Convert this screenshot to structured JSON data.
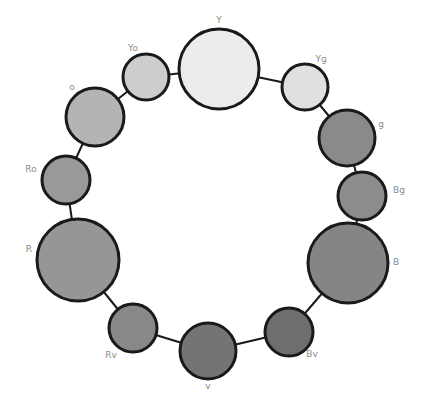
{
  "diagram": {
    "type": "color-wheel-circles",
    "nodes": [
      {
        "id": "Y",
        "label": "Y",
        "cx": 219,
        "cy": 69,
        "r": 40,
        "fill": "#ececec",
        "lx": 219,
        "ly": 23,
        "anchor": "middle"
      },
      {
        "id": "Yg",
        "label": "Yg",
        "cx": 305,
        "cy": 87,
        "r": 23,
        "fill": "#e0e0e0",
        "lx": 321,
        "ly": 62,
        "anchor": "middle"
      },
      {
        "id": "g",
        "label": "g",
        "cx": 347,
        "cy": 138,
        "r": 28,
        "fill": "#8a8a8a",
        "lx": 381,
        "ly": 127,
        "anchor": "middle"
      },
      {
        "id": "Bg",
        "label": "Bg",
        "cx": 362,
        "cy": 196,
        "r": 24,
        "fill": "#8c8c8c",
        "lx": 399,
        "ly": 193,
        "anchor": "middle"
      },
      {
        "id": "B",
        "label": "B",
        "cx": 348,
        "cy": 263,
        "r": 40,
        "fill": "#858585",
        "lx": 396,
        "ly": 265,
        "anchor": "middle"
      },
      {
        "id": "Bv",
        "label": "Bv",
        "cx": 289,
        "cy": 332,
        "r": 24,
        "fill": "#6e6e6e",
        "lx": 312,
        "ly": 357,
        "anchor": "middle"
      },
      {
        "id": "v",
        "label": "v",
        "cx": 208,
        "cy": 351,
        "r": 28,
        "fill": "#747474",
        "lx": 208,
        "ly": 389,
        "anchor": "middle"
      },
      {
        "id": "Rv",
        "label": "Rv",
        "cx": 133,
        "cy": 328,
        "r": 24,
        "fill": "#888888",
        "lx": 111,
        "ly": 358,
        "anchor": "middle"
      },
      {
        "id": "R",
        "label": "R",
        "cx": 78,
        "cy": 260,
        "r": 41,
        "fill": "#969696",
        "lx": 29,
        "ly": 252,
        "anchor": "middle"
      },
      {
        "id": "Ro",
        "label": "Ro",
        "cx": 66,
        "cy": 180,
        "r": 24,
        "fill": "#999999",
        "lx": 31,
        "ly": 172,
        "anchor": "middle"
      },
      {
        "id": "o",
        "label": "o",
        "cx": 95,
        "cy": 117,
        "r": 29,
        "fill": "#b4b4b4",
        "lx": 72,
        "ly": 90,
        "anchor": "middle"
      },
      {
        "id": "Yo",
        "label": "Yo",
        "cx": 146,
        "cy": 77,
        "r": 23,
        "fill": "#cdcdcd",
        "lx": 133,
        "ly": 51,
        "anchor": "middle"
      }
    ],
    "edges": [
      [
        "Y",
        "Yg"
      ],
      [
        "Yg",
        "g"
      ],
      [
        "g",
        "Bg"
      ],
      [
        "Bg",
        "B"
      ],
      [
        "B",
        "Bv"
      ],
      [
        "Bv",
        "v"
      ],
      [
        "v",
        "Rv"
      ],
      [
        "Rv",
        "R"
      ],
      [
        "R",
        "Ro"
      ],
      [
        "Ro",
        "o"
      ],
      [
        "o",
        "Yo"
      ],
      [
        "Yo",
        "Y"
      ]
    ]
  }
}
